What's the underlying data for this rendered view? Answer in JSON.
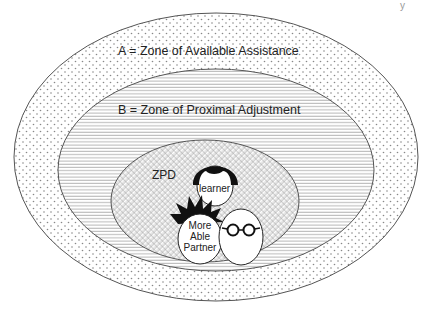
{
  "diagram": {
    "zones": [
      {
        "id": "A",
        "label": "A = Zone of Available Assistance",
        "fill_pattern": "dots"
      },
      {
        "id": "B",
        "label": "B = Zone of Proximal Adjustment",
        "fill_pattern": "horizontal-lines"
      },
      {
        "id": "ZPD",
        "label": "ZPD",
        "fill_pattern": "diagonal-hatch"
      }
    ],
    "figures": {
      "learner": {
        "label": "learner"
      },
      "partner": {
        "label_lines": [
          "More",
          "Able",
          "Partner"
        ]
      }
    },
    "page_mark": "y"
  }
}
